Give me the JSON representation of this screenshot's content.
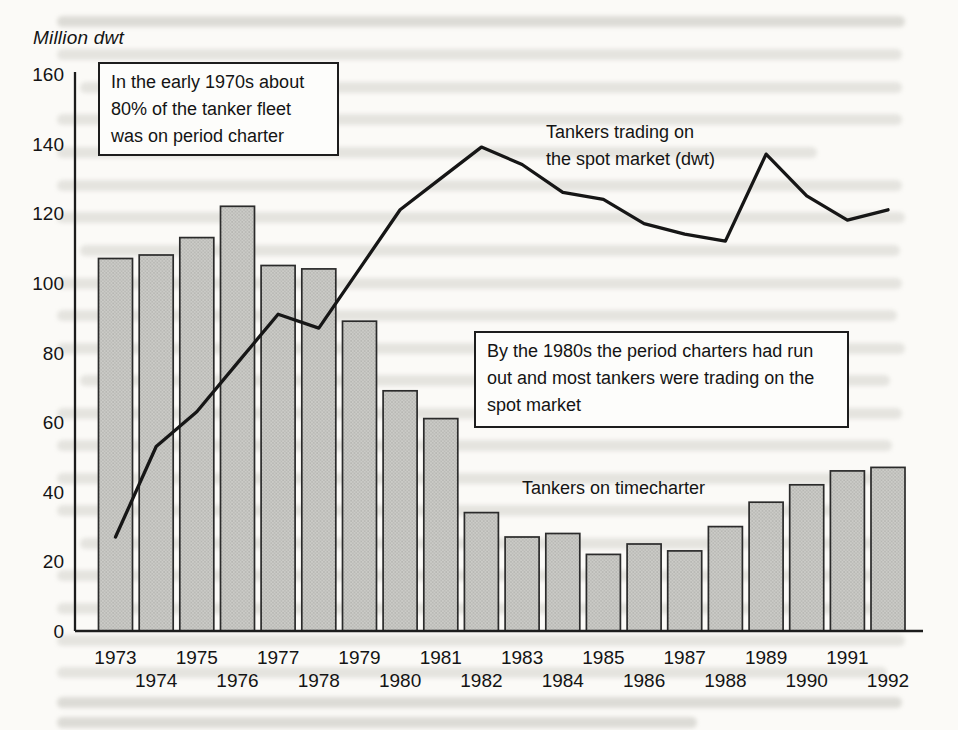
{
  "figure": {
    "y_axis_title": "Million dwt",
    "annotations": {
      "early_1970s_box": "In the early 1970s about 80% of the tanker fleet was on period charter",
      "mid_1980s_box": "By the 1980s the period charters had run out and most tankers were trading on the spot market",
      "spot_line_label_line1": "Tankers trading on",
      "spot_line_label_line2": "the spot market (dwt)",
      "timecharter_bar_label": "Tankers on timecharter"
    },
    "colors": {
      "bar_fill": "#cbcbc7",
      "bar_dot": "#9d9d99",
      "bar_stroke": "#2b2b2b",
      "line_stroke": "#161616",
      "axis_stroke": "#1c1c1c",
      "paper": "#fbfaf7"
    }
  },
  "chart_data": {
    "type": "bar",
    "subtype": "bar-and-line-combo",
    "title": "",
    "xlabel": "",
    "ylabel": "Million dwt",
    "ylim": [
      0,
      160
    ],
    "yticks": [
      0,
      20,
      40,
      60,
      80,
      100,
      120,
      140,
      160
    ],
    "grid": false,
    "legend_position": "inline-annotations",
    "categories": [
      "1973",
      "1974",
      "1975",
      "1976",
      "1977",
      "1978",
      "1979",
      "1980",
      "1981",
      "1982",
      "1983",
      "1984",
      "1985",
      "1986",
      "1987",
      "1988",
      "1989",
      "1990",
      "1991",
      "1992"
    ],
    "series": [
      {
        "name": "Tankers on timecharter",
        "type": "bar",
        "values": [
          107,
          108,
          113,
          122,
          105,
          104,
          89,
          69,
          61,
          34,
          27,
          28,
          22,
          25,
          23,
          30,
          37,
          42,
          46,
          47
        ]
      },
      {
        "name": "Tankers trading on the spot market (dwt)",
        "type": "line",
        "values": [
          27,
          53,
          63,
          77,
          91,
          87,
          104,
          121,
          130,
          139,
          134,
          126,
          124,
          117,
          114,
          112,
          137,
          125,
          118,
          121
        ]
      }
    ]
  }
}
